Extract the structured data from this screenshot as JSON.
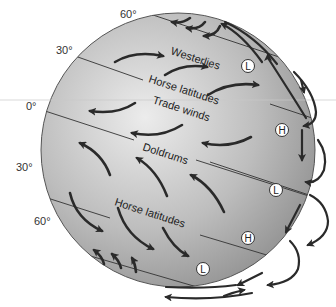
{
  "diagram": {
    "latitude_labels": {
      "lat60n": "60°",
      "lat30n": "30°",
      "lat0": "0°",
      "lat30s": "30°",
      "lat60s": "60°"
    },
    "zone_labels": {
      "westerlies": "Westerlies",
      "horse_latitudes_north": "Horse latitudes",
      "trade_winds": "Trade winds",
      "doldrums": "Doldrums",
      "horse_latitudes_south": "Horse latitudes"
    },
    "pressure_markers": [
      {
        "id": "l1",
        "label": "L"
      },
      {
        "id": "h1",
        "label": "H"
      },
      {
        "id": "l2",
        "label": "L"
      },
      {
        "id": "h2",
        "label": "H"
      },
      {
        "id": "l3",
        "label": "L"
      }
    ],
    "colors": {
      "globe_light": "#e6e6e6",
      "globe_dark": "#8a8a8a",
      "arrow": "#2a2a2a",
      "line": "#333333",
      "equator_guide": "#bbbbbb"
    }
  }
}
